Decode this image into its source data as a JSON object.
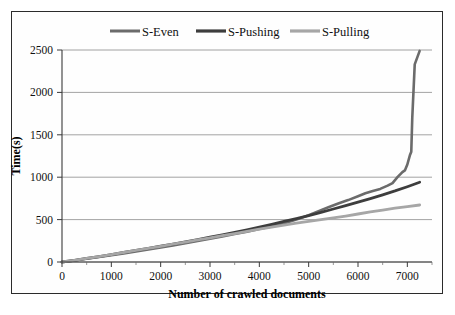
{
  "chart_data": {
    "type": "line",
    "title": "",
    "xlabel": "Number of crawled documents",
    "ylabel": "Time(s)",
    "xlim": [
      0,
      7500
    ],
    "ylim": [
      0,
      2500
    ],
    "xticks": [
      0,
      1000,
      2000,
      3000,
      4000,
      5000,
      6000,
      7000
    ],
    "yticks": [
      0,
      500,
      1000,
      1500,
      2000,
      2500
    ],
    "minor_x_step": 500,
    "grid": "horizontal",
    "legend_position": "top",
    "series": [
      {
        "name": "S-Even",
        "color": "#6b6b6b",
        "width": 2.6,
        "x": [
          0,
          250,
          500,
          750,
          1000,
          1250,
          1500,
          1750,
          2000,
          2250,
          2500,
          2750,
          3000,
          3250,
          3500,
          3750,
          4000,
          4250,
          4500,
          4750,
          5000,
          5200,
          5400,
          5600,
          5800,
          6000,
          6150,
          6300,
          6450,
          6600,
          6700,
          6800,
          6900,
          6950,
          7000,
          7050,
          7080,
          7100,
          7150,
          7250
        ],
        "y": [
          0,
          18,
          38,
          58,
          80,
          102,
          125,
          148,
          172,
          196,
          222,
          248,
          275,
          302,
          330,
          358,
          388,
          420,
          455,
          500,
          552,
          600,
          645,
          690,
          730,
          775,
          810,
          838,
          862,
          900,
          930,
          1000,
          1060,
          1080,
          1150,
          1255,
          1300,
          1700,
          2330,
          2490
        ]
      },
      {
        "name": "S-Pushing",
        "color": "#3d3d3d",
        "width": 2.8,
        "x": [
          0,
          250,
          500,
          750,
          1000,
          1250,
          1500,
          1750,
          2000,
          2250,
          2500,
          2750,
          3000,
          3250,
          3500,
          3750,
          4000,
          4250,
          4500,
          4750,
          5000,
          5250,
          5500,
          5750,
          6000,
          6250,
          6500,
          6750,
          7000,
          7250
        ],
        "y": [
          0,
          20,
          42,
          64,
          88,
          112,
          136,
          160,
          186,
          212,
          238,
          265,
          292,
          320,
          350,
          380,
          412,
          444,
          478,
          512,
          548,
          586,
          625,
          665,
          706,
          748,
          792,
          838,
          888,
          940
        ]
      },
      {
        "name": "S-Pulling",
        "color": "#a6a6a6",
        "width": 2.8,
        "x": [
          0,
          250,
          500,
          750,
          1000,
          1250,
          1500,
          1750,
          2000,
          2250,
          2500,
          2750,
          3000,
          3250,
          3500,
          3750,
          4000,
          4250,
          4500,
          4750,
          5000,
          5250,
          5500,
          5750,
          6000,
          6250,
          6500,
          6750,
          7000,
          7250
        ],
        "y": [
          0,
          20,
          42,
          64,
          88,
          112,
          136,
          160,
          185,
          210,
          235,
          260,
          285,
          310,
          336,
          362,
          388,
          412,
          436,
          458,
          480,
          500,
          520,
          542,
          566,
          590,
          612,
          634,
          654,
          672
        ]
      }
    ]
  },
  "legend": {
    "items": [
      {
        "label": "S-Even"
      },
      {
        "label": "S-Pushing"
      },
      {
        "label": "S-Pulling"
      }
    ]
  }
}
